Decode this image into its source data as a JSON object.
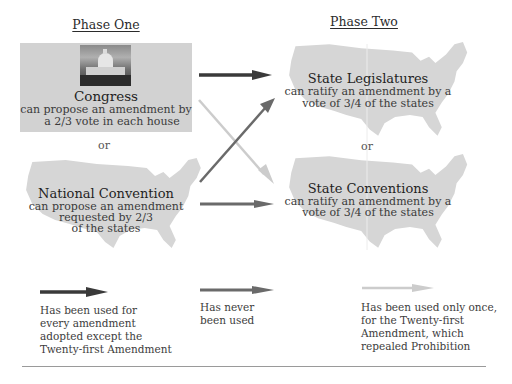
{
  "phase_one": {
    "title": "Phase One",
    "congress": {
      "title": "Congress",
      "desc_line1": "can propose an amendment by",
      "desc_line2": "a 2/3 vote in each house",
      "image": "us-capitol-photo"
    },
    "or_label": "or",
    "national_convention": {
      "title": "National Convention",
      "desc_line1": "can propose an amendment",
      "desc_line2": "requested by 2/3",
      "desc_line3": "of the states",
      "image": "us-map-silhouette"
    }
  },
  "phase_two": {
    "title": "Phase Two",
    "state_legislatures": {
      "title": "State Legislatures",
      "desc_line1": "can ratify an amendment by a",
      "desc_line2": "vote of 3/4 of the states",
      "image": "us-map-silhouette"
    },
    "or_label": "or",
    "state_conventions": {
      "title": "State Conventions",
      "desc_line1": "can ratify an amendment by a",
      "desc_line2": "vote of 3/4 of the states",
      "image": "us-map-silhouette"
    }
  },
  "arrows": {
    "congress_to_legislatures": {
      "style": "dark",
      "color": "#3a3a3a"
    },
    "congress_to_conventions": {
      "style": "light",
      "color": "#c8c8c8"
    },
    "convention_to_legislatures": {
      "style": "medium",
      "color": "#6a6a6a"
    },
    "convention_to_conventions": {
      "style": "medium",
      "color": "#6a6a6a"
    }
  },
  "legend": [
    {
      "arrow_style": "dark",
      "color": "#3a3a3a",
      "lines": [
        "Has been used for",
        "every amendment",
        "adopted except the",
        "Twenty-first Amendment"
      ]
    },
    {
      "arrow_style": "medium",
      "color": "#6a6a6a",
      "lines": [
        "Has never",
        "been used"
      ]
    },
    {
      "arrow_style": "light",
      "color": "#c8c8c8",
      "lines": [
        "Has been used only once,",
        "for the Twenty-first",
        "Amendment, which",
        "repealed Prohibition"
      ]
    }
  ],
  "colors": {
    "box_fill": "#d2d2d2",
    "map_fill": "#d6d6d6",
    "rule": "#9a9a9a"
  }
}
